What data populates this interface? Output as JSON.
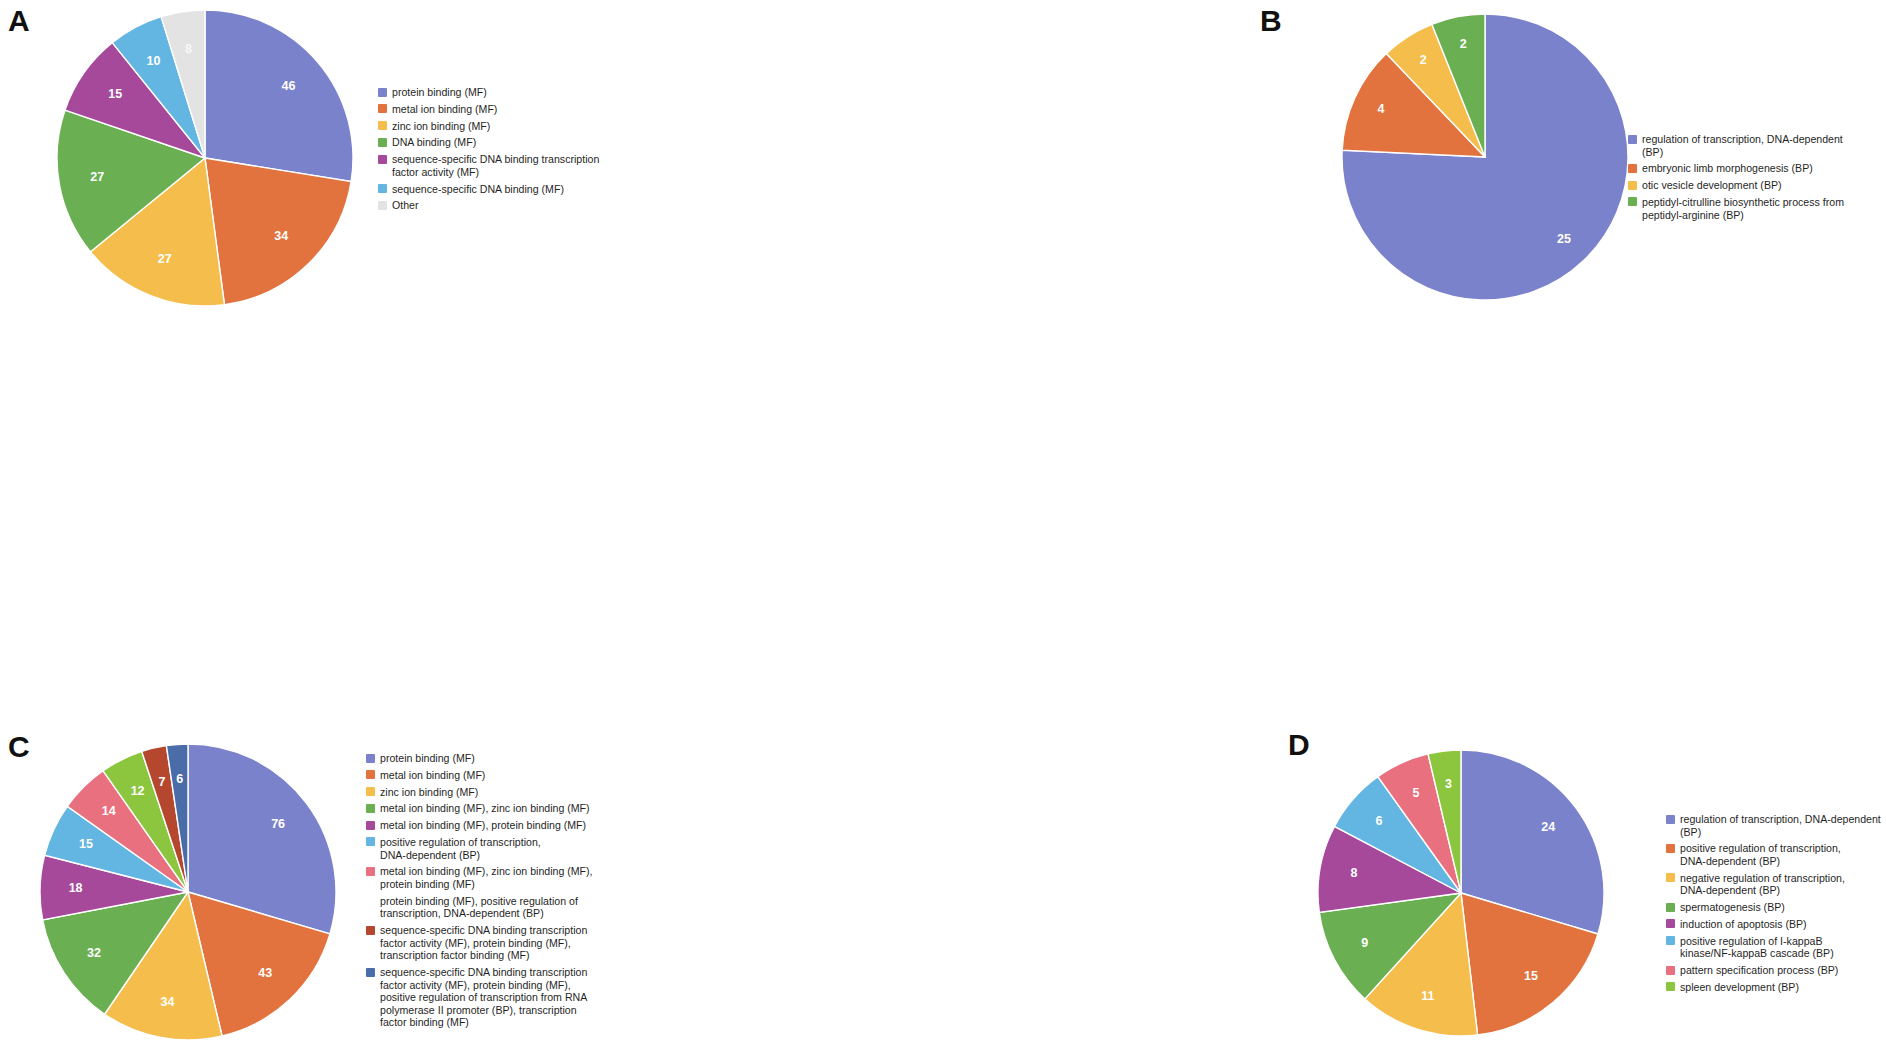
{
  "figure": {
    "panels": [
      "A",
      "B",
      "C",
      "D"
    ]
  },
  "panelA": {
    "letter": "A",
    "legend": [
      {
        "label": "protein binding (MF)",
        "color": "#7b82cc"
      },
      {
        "label": "metal ion binding (MF)",
        "color": "#e2733e"
      },
      {
        "label": "zinc ion binding (MF)",
        "color": "#f5bd4b"
      },
      {
        "label": "DNA binding (MF)",
        "color": "#6aaf52"
      },
      {
        "label": "sequence-specific DNA binding transcription\nfactor activity (MF)",
        "color": "#a6499a"
      },
      {
        "label": "sequence-specific DNA binding (MF)",
        "color": "#63b5e2"
      },
      {
        "label": "Other",
        "color": "#e3e3e3"
      }
    ]
  },
  "panelB": {
    "letter": "B",
    "legend": [
      {
        "label": "regulation of transcription, DNA-dependent\n(BP)",
        "color": "#7b82cc"
      },
      {
        "label": "embryonic limb morphogenesis (BP)",
        "color": "#e2733e"
      },
      {
        "label": "otic vesicle development (BP)",
        "color": "#f5bd4b"
      },
      {
        "label": "peptidyl-citrulline biosynthetic process from\npeptidyl-arginine (BP)",
        "color": "#6aaf52"
      }
    ]
  },
  "panelC": {
    "letter": "C",
    "legend": [
      {
        "label": "protein binding (MF)",
        "color": "#7b82cc"
      },
      {
        "label": "metal ion binding (MF)",
        "color": "#e2733e"
      },
      {
        "label": "zinc ion binding (MF)",
        "color": "#f5bd4b"
      },
      {
        "label": "metal ion binding (MF), zinc ion binding (MF)",
        "color": "#6aaf52"
      },
      {
        "label": "metal ion binding (MF), protein binding (MF)",
        "color": "#a6499a"
      },
      {
        "label": "positive regulation of transcription,\nDNA-dependent (BP)",
        "color": "#63b5e2"
      },
      {
        "label": "metal ion binding (MF), zinc ion binding (MF),\nprotein binding (MF)",
        "color": "#e8707f"
      },
      {
        "label": "protein binding (MF), positive regulation of\ntranscription, DNA-dependent (BP)",
        "color": "#9bc council"
      },
      {
        "label": "sequence-specific DNA binding transcription\nfactor activity (MF), protein binding (MF),\ntranscription factor binding (MF)",
        "color": "#b5472f"
      },
      {
        "label": "sequence-specific DNA binding transcription\nfactor activity (MF), protein binding (MF),\npositive regulation of transcription from RNA\npolymerase II promoter (BP), transcription\nfactor binding (MF)",
        "color": "#4a6ca8"
      }
    ]
  },
  "panelD": {
    "letter": "D",
    "legend": [
      {
        "label": "regulation of transcription, DNA-dependent\n(BP)",
        "color": "#7b82cc"
      },
      {
        "label": "positive regulation of transcription,\nDNA-dependent (BP)",
        "color": "#e2733e"
      },
      {
        "label": "negative regulation of transcription,\nDNA-dependent (BP)",
        "color": "#f5bd4b"
      },
      {
        "label": "spermatogenesis (BP)",
        "color": "#6aaf52"
      },
      {
        "label": "induction of apoptosis (BP)",
        "color": "#a6499a"
      },
      {
        "label": "positive regulation of I-kappaB\nkinase/NF-kappaB cascade (BP)",
        "color": "#63b5e2"
      },
      {
        "label": "pattern specification process (BP)",
        "color": "#e8707f"
      },
      {
        "label": "spleen development (BP)",
        "color": "#8cc63f"
      }
    ]
  },
  "chart_data": [
    {
      "type": "pie",
      "panel": "A",
      "title": "",
      "categories": [
        "protein binding (MF)",
        "metal ion binding (MF)",
        "zinc ion binding (MF)",
        "DNA binding (MF)",
        "sequence-specific DNA binding transcription factor activity (MF)",
        "sequence-specific DNA binding (MF)",
        "Other"
      ],
      "values": [
        46,
        34,
        27,
        27,
        15,
        10,
        8
      ],
      "colors": [
        "#7b82cc",
        "#e2733e",
        "#f5bd4b",
        "#6aaf52",
        "#a6499a",
        "#63b5e2",
        "#e3e3e3"
      ],
      "labels_shown": [
        "46",
        "34",
        "27",
        "27",
        "15",
        "10",
        "8"
      ],
      "legend_position": "right",
      "start_angle": 0,
      "grid": false
    },
    {
      "type": "pie",
      "panel": "B",
      "title": "",
      "categories": [
        "regulation of transcription, DNA-dependent (BP)",
        "embryonic limb morphogenesis (BP)",
        "otic vesicle development (BP)",
        "peptidyl-citrulline biosynthetic process from peptidyl-arginine (BP)"
      ],
      "values": [
        25,
        4,
        2,
        2
      ],
      "colors": [
        "#7b82cc",
        "#e2733e",
        "#f5bd4b",
        "#6aaf52"
      ],
      "labels_shown": [
        "25",
        "4",
        "2",
        "2"
      ],
      "legend_position": "right",
      "start_angle": 0,
      "grid": false
    },
    {
      "type": "pie",
      "panel": "C",
      "title": "",
      "categories": [
        "protein binding (MF)",
        "metal ion binding (MF)",
        "zinc ion binding (MF)",
        "metal ion binding (MF), zinc ion binding (MF)",
        "metal ion binding (MF), protein binding (MF)",
        "positive regulation of transcription, DNA-dependent (BP)",
        "metal ion binding (MF), zinc ion binding (MF), protein binding (MF)",
        "protein binding (MF), positive regulation of transcription, DNA-dependent (BP)",
        "sequence-specific DNA binding transcription factor activity (MF), protein binding (MF), transcription factor binding (MF)",
        "sequence-specific DNA binding transcription factor activity (MF), protein binding (MF), positive regulation of transcription from RNA polymerase II promoter (BP), transcription factor binding (MF)"
      ],
      "values": [
        76,
        43,
        34,
        32,
        18,
        15,
        14,
        12,
        7,
        6
      ],
      "colors": [
        "#7b82cc",
        "#e2733e",
        "#f5bd4b",
        "#6aaf52",
        "#a6499a",
        "#63b5e2",
        "#e8707f",
        "#8cc63f",
        "#b5472f",
        "#4a6ca8"
      ],
      "labels_shown": [
        "76",
        "43",
        "34",
        "32",
        "18",
        "15",
        "14",
        "12",
        "7",
        "6"
      ],
      "legend_position": "right",
      "start_angle": 0,
      "grid": false
    },
    {
      "type": "pie",
      "panel": "D",
      "title": "",
      "categories": [
        "regulation of transcription, DNA-dependent (BP)",
        "positive regulation of transcription, DNA-dependent (BP)",
        "negative regulation of transcription, DNA-dependent (BP)",
        "spermatogenesis (BP)",
        "induction of apoptosis (BP)",
        "positive regulation of I-kappaB kinase/NF-kappaB cascade (BP)",
        "pattern specification process (BP)",
        "spleen development (BP)"
      ],
      "values": [
        24,
        15,
        11,
        9,
        8,
        6,
        5,
        3
      ],
      "colors": [
        "#7b82cc",
        "#e2733e",
        "#f5bd4b",
        "#6aaf52",
        "#a6499a",
        "#63b5e2",
        "#e8707f",
        "#8cc63f"
      ],
      "labels_shown": [
        "24",
        "15",
        "11",
        "9",
        "8",
        "6",
        "5",
        "3"
      ],
      "legend_position": "right",
      "start_angle": 0,
      "grid": false
    }
  ]
}
